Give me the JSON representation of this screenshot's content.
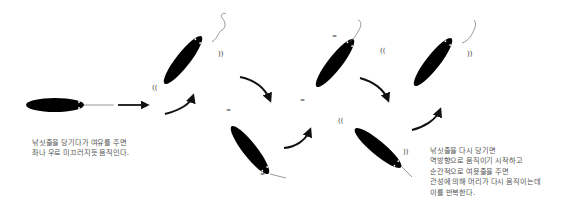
{
  "diagram": {
    "title": "",
    "colors": {
      "lure_fill": "#000000",
      "arrow": "#111111",
      "text": "#555555",
      "line": "#555555",
      "background": "#ffffff"
    },
    "lures": [
      {
        "id": "lure-1",
        "state": "horizontal",
        "description": "lure being pulled straight"
      },
      {
        "id": "lure-2",
        "state": "tilted-up",
        "description": "lure head up, sliding"
      },
      {
        "id": "lure-3",
        "state": "tilted-down",
        "description": "lure head down, sliding"
      },
      {
        "id": "lure-4",
        "state": "tilted-up",
        "description": "lure head up, sliding"
      },
      {
        "id": "lure-5",
        "state": "tilted-down",
        "description": "lure head down, sliding"
      },
      {
        "id": "lure-6",
        "state": "tilted-up",
        "description": "lure head up, sliding"
      }
    ],
    "icons": [
      "straight-arrow-icon",
      "curved-arrow-icon",
      "vibration-mark-icon",
      "fishing-line-icon"
    ],
    "captions": {
      "left": {
        "lines": [
          "낚싯줄을 당기다가 여유를 주면",
          "좌나 우로 미끄러지듯 움직인다."
        ]
      },
      "right": {
        "lines": [
          "낚싯줄을 다시 당기면",
          "역방향으로 움직이기 시작하고",
          "순간적으로 여윳줄을 주면",
          "관성에 의해 머리가 다시 움직이는데",
          "이를 반복한다."
        ]
      }
    }
  }
}
